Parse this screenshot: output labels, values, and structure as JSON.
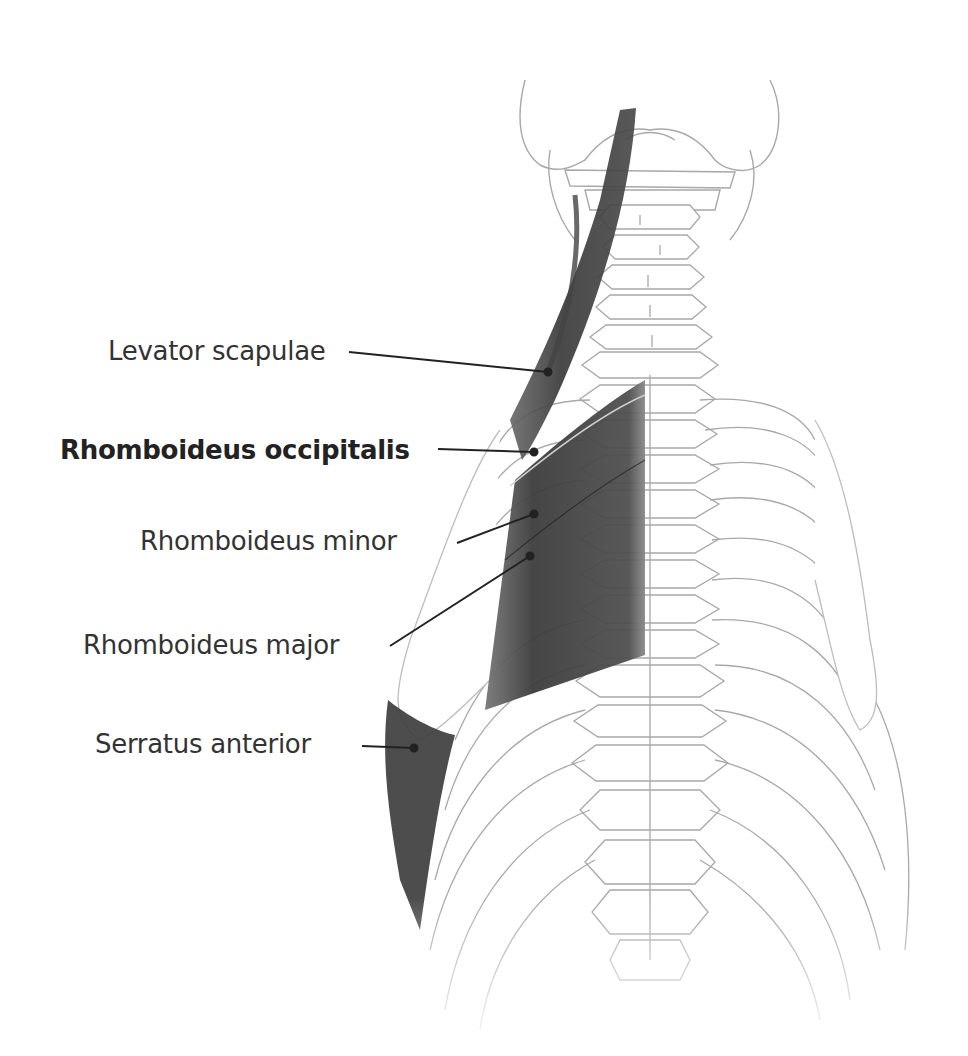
{
  "figure": {
    "highlight_color": "#3a3a3a",
    "line_color": "#9a9a9a",
    "label_color": "#333333"
  },
  "labels": [
    {
      "id": "levator-scapulae",
      "text": "Levator scapulae",
      "bold": false,
      "x": 108,
      "y": 338,
      "leader": [
        [
          349,
          352
        ],
        [
          548,
          372
        ]
      ]
    },
    {
      "id": "rhomboideus-occipitalis",
      "text": "Rhomboideus occipitalis",
      "bold": true,
      "x": 60,
      "y": 437,
      "leader": [
        [
          438,
          449
        ],
        [
          534,
          452
        ]
      ]
    },
    {
      "id": "rhomboideus-minor",
      "text": "Rhomboideus minor",
      "bold": false,
      "x": 140,
      "y": 528,
      "leader": [
        [
          457,
          543
        ],
        [
          534,
          514
        ]
      ]
    },
    {
      "id": "rhomboideus-major",
      "text": "Rhomboideus major",
      "bold": false,
      "x": 83,
      "y": 632,
      "leader": [
        [
          390,
          646
        ],
        [
          530,
          556
        ]
      ]
    },
    {
      "id": "serratus-anterior",
      "text": "Serratus anterior",
      "bold": false,
      "x": 95,
      "y": 731,
      "leader": [
        [
          362,
          746
        ],
        [
          414,
          748
        ]
      ]
    }
  ]
}
